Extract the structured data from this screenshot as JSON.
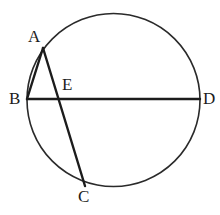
{
  "figure": {
    "background_color": "#ffffff",
    "stroke_color": "#1c1c1c",
    "circle_stroke_color": "#2a2a2a",
    "label_color": "#1c1c1c",
    "circle": {
      "name": "circle-outline",
      "cx": 113.5,
      "cy": 100,
      "r": 86.5,
      "stroke_width": 1.6
    },
    "points": [
      {
        "id": "A",
        "label": "A",
        "x": 43,
        "y": 48,
        "label_x": 28,
        "label_y": 28
      },
      {
        "id": "B",
        "label": "B",
        "x": 27,
        "y": 99,
        "label_x": 9,
        "label_y": 90
      },
      {
        "id": "E",
        "label": "E",
        "x": 60,
        "y": 99,
        "label_x": 62,
        "label_y": 76
      },
      {
        "id": "D",
        "label": "D",
        "x": 200,
        "y": 99,
        "label_x": 203,
        "label_y": 90
      },
      {
        "id": "C",
        "label": "C",
        "x": 85,
        "y": 186,
        "label_x": 78,
        "label_y": 188
      }
    ],
    "segments": [
      {
        "id": "BD",
        "name": "chord-bd",
        "x1": 27,
        "y1": 99,
        "x2": 200,
        "y2": 99,
        "stroke_width": 2.4
      },
      {
        "id": "AB",
        "name": "chord-ab",
        "x1": 43,
        "y1": 48,
        "x2": 27,
        "y2": 99,
        "stroke_width": 2.4
      },
      {
        "id": "AC",
        "name": "chord-ac",
        "x1": 43,
        "y1": 48,
        "x2": 85,
        "y2": 186,
        "stroke_width": 2.4
      }
    ],
    "label_font_size": "17px"
  }
}
